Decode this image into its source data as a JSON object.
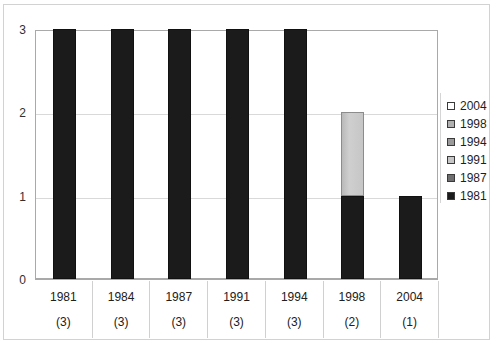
{
  "chart_data": {
    "type": "bar",
    "title": "",
    "subtitle": "",
    "xlabel": "",
    "ylabel": "",
    "stacked": true,
    "grid": true,
    "legend_position": "right",
    "ylim": [
      0,
      3
    ],
    "yticks": [
      "0",
      "1",
      "2",
      "3"
    ],
    "categories": [
      "1981",
      "1984",
      "1987",
      "1991",
      "1994",
      "1998",
      "2004"
    ],
    "category_counts": [
      "(3)",
      "(3)",
      "(3)",
      "(3)",
      "(3)",
      "(2)",
      "(1)"
    ],
    "values": [
      3,
      3,
      3,
      3,
      3,
      2,
      1
    ],
    "series": [
      {
        "name": "1981",
        "color": "#1b1b1b",
        "values": [
          3,
          3,
          3,
          3,
          3,
          1,
          1
        ]
      },
      {
        "name": "1987",
        "color": "#6e6e6e",
        "values": [
          0,
          0,
          0,
          0,
          0,
          0,
          0
        ]
      },
      {
        "name": "1991",
        "color": "#c6c6c6",
        "values": [
          0,
          0,
          0,
          0,
          0,
          1,
          0
        ]
      },
      {
        "name": "1994",
        "color": "#9a9a9a",
        "values": [
          0,
          0,
          0,
          0,
          0,
          0,
          0
        ]
      },
      {
        "name": "1998",
        "color": "#b0b0b0",
        "values": [
          0,
          0,
          0,
          0,
          0,
          0,
          0
        ]
      },
      {
        "name": "2004",
        "color": "#ffffff",
        "values": [
          0,
          0,
          0,
          0,
          0,
          0,
          0
        ]
      }
    ],
    "bars": [
      {
        "category": "1981",
        "count": "(3)",
        "segments": [
          {
            "from": 0,
            "to": 3,
            "shade": "dark"
          }
        ]
      },
      {
        "category": "1984",
        "count": "(3)",
        "segments": [
          {
            "from": 0,
            "to": 3,
            "shade": "dark"
          }
        ]
      },
      {
        "category": "1987",
        "count": "(3)",
        "segments": [
          {
            "from": 0,
            "to": 3,
            "shade": "dark"
          }
        ]
      },
      {
        "category": "1991",
        "count": "(3)",
        "segments": [
          {
            "from": 0,
            "to": 3,
            "shade": "dark"
          }
        ]
      },
      {
        "category": "1994",
        "count": "(3)",
        "segments": [
          {
            "from": 0,
            "to": 3,
            "shade": "dark"
          }
        ]
      },
      {
        "category": "1998",
        "count": "(2)",
        "segments": [
          {
            "from": 0,
            "to": 1,
            "shade": "dark"
          },
          {
            "from": 1,
            "to": 2,
            "shade": "light"
          }
        ]
      },
      {
        "category": "2004",
        "count": "(1)",
        "segments": [
          {
            "from": 0,
            "to": 1,
            "shade": "dark"
          }
        ]
      }
    ]
  },
  "axis": {
    "y_ticks": [
      {
        "label": "3",
        "value": 3
      },
      {
        "label": "2",
        "value": 2
      },
      {
        "label": "1",
        "value": 1
      },
      {
        "label": "0",
        "value": 0
      }
    ]
  },
  "legend": {
    "items": [
      {
        "label": "2004",
        "swatch": "#ffffff"
      },
      {
        "label": "1998",
        "swatch": "#b0b0b0"
      },
      {
        "label": "1994",
        "swatch": "#9a9a9a"
      },
      {
        "label": "1991",
        "swatch": "#c6c6c6"
      },
      {
        "label": "1987",
        "swatch": "#6e6e6e"
      },
      {
        "label": "1981",
        "swatch": "#1b1b1b"
      }
    ]
  },
  "colors": {
    "bar_dark": "#1b1b1b",
    "bar_light": "#c6c6c6",
    "gridline": "#d9d9d9",
    "axis": "#a9a9a9",
    "frame": "#d2d2d2",
    "text": "#202020",
    "background": "#ffffff"
  }
}
